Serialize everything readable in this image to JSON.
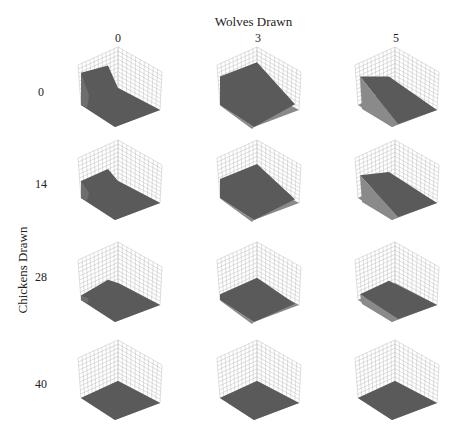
{
  "chart_data": {
    "type": "surface3d-grid",
    "title": "Wolves Drawn",
    "xlabel": "Wolves Drawn",
    "ylabel": "Chickens Drawn",
    "column_values": [
      "0",
      "3",
      "5"
    ],
    "row_values": [
      "0",
      "14",
      "28",
      "40"
    ],
    "grid": true,
    "panels": [
      {
        "row": "0",
        "col": "0",
        "surface": "high wall on back-left edge, sloping surface, elevated region"
      },
      {
        "row": "0",
        "col": "3",
        "surface": "large sloped surface descending toward front-right"
      },
      {
        "row": "0",
        "col": "5",
        "surface": "steep diagonal sloped surface, high on left"
      },
      {
        "row": "14",
        "col": "0",
        "surface": "low wall on left, mostly flat raised surface"
      },
      {
        "row": "14",
        "col": "3",
        "surface": "moderately sloped surface, lower than row 0"
      },
      {
        "row": "14",
        "col": "5",
        "surface": "sloped surface high toward back-left"
      },
      {
        "row": "28",
        "col": "0",
        "surface": "nearly flat, slight ridge"
      },
      {
        "row": "28",
        "col": "3",
        "surface": "nearly flat with slight center peak"
      },
      {
        "row": "28",
        "col": "5",
        "surface": "nearly flat, slight raised region"
      },
      {
        "row": "40",
        "col": "0",
        "surface": "flat"
      },
      {
        "row": "40",
        "col": "3",
        "surface": "flat"
      },
      {
        "row": "40",
        "col": "5",
        "surface": "flat"
      }
    ]
  },
  "labels": {
    "top_title": "Wolves Drawn",
    "side_title": "Chickens Drawn",
    "cols": [
      "0",
      "3",
      "5"
    ],
    "rows": [
      "0",
      "14",
      "28",
      "40"
    ]
  },
  "colors": {
    "surface": "#5a5a5a",
    "surface_light": "#6e6e6e",
    "floor": "#8a8a8a",
    "grid": "#bdbdbd"
  }
}
